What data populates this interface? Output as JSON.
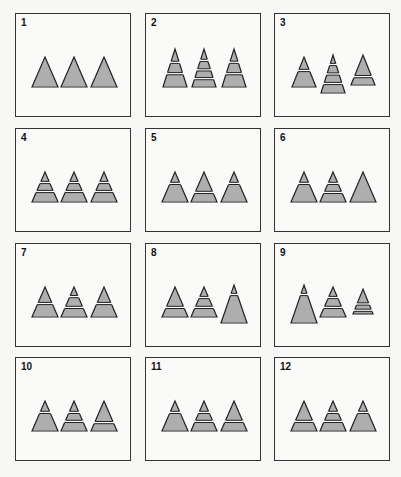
{
  "figure": {
    "colors": {
      "fill": "#a8a8a8",
      "stroke": "#222222",
      "gap": "#fafaf8",
      "frame": "#333333"
    },
    "panels": [
      {
        "label": "1",
        "triangles": [
          {
            "dx": 0,
            "dy": 0,
            "w": 26,
            "h": 30,
            "cuts": []
          },
          {
            "dx": 0,
            "dy": 0,
            "w": 26,
            "h": 30,
            "cuts": []
          },
          {
            "dx": 0,
            "dy": 0,
            "w": 26,
            "h": 30,
            "cuts": []
          }
        ]
      },
      {
        "label": "2",
        "triangles": [
          {
            "dx": 0,
            "dy": 0,
            "w": 24,
            "h": 38,
            "cuts": [
              0.35,
              0.65
            ]
          },
          {
            "dx": 0,
            "dy": 0,
            "w": 24,
            "h": 38,
            "cuts": [
              0.3,
              0.55,
              0.78
            ]
          },
          {
            "dx": 0,
            "dy": 0,
            "w": 24,
            "h": 38,
            "cuts": [
              0.35,
              0.65
            ]
          }
        ]
      },
      {
        "label": "3",
        "triangles": [
          {
            "dx": 0,
            "dy": 0,
            "w": 24,
            "h": 30,
            "cuts": [
              0.45
            ]
          },
          {
            "dx": 0,
            "dy": 6,
            "w": 24,
            "h": 38,
            "cuts": [
              0.25,
              0.5,
              0.75
            ]
          },
          {
            "dx": 0,
            "dy": -2,
            "w": 24,
            "h": 30,
            "cuts": [
              0.72
            ]
          }
        ]
      },
      {
        "label": "4",
        "triangles": [
          {
            "dx": 0,
            "dy": 0,
            "w": 26,
            "h": 30,
            "cuts": [
              0.35,
              0.65
            ]
          },
          {
            "dx": 0,
            "dy": 0,
            "w": 26,
            "h": 30,
            "cuts": [
              0.35,
              0.65
            ]
          },
          {
            "dx": 0,
            "dy": 0,
            "w": 26,
            "h": 30,
            "cuts": [
              0.35,
              0.65
            ]
          }
        ]
      },
      {
        "label": "5",
        "triangles": [
          {
            "dx": 0,
            "dy": 0,
            "w": 26,
            "h": 30,
            "cuts": [
              0.38
            ]
          },
          {
            "dx": 0,
            "dy": 0,
            "w": 26,
            "h": 30,
            "cuts": [
              0.68
            ]
          },
          {
            "dx": 0,
            "dy": 0,
            "w": 26,
            "h": 30,
            "cuts": [
              0.38
            ]
          }
        ]
      },
      {
        "label": "6",
        "triangles": [
          {
            "dx": 0,
            "dy": 0,
            "w": 26,
            "h": 30,
            "cuts": [
              0.38
            ]
          },
          {
            "dx": 0,
            "dy": 0,
            "w": 26,
            "h": 30,
            "cuts": [
              0.38,
              0.68
            ]
          },
          {
            "dx": 0,
            "dy": 0,
            "w": 26,
            "h": 30,
            "cuts": []
          }
        ]
      },
      {
        "label": "7",
        "triangles": [
          {
            "dx": 0,
            "dy": 0,
            "w": 26,
            "h": 30,
            "cuts": [
              0.55
            ]
          },
          {
            "dx": 0,
            "dy": 0,
            "w": 26,
            "h": 30,
            "cuts": [
              0.32,
              0.68
            ]
          },
          {
            "dx": 0,
            "dy": 0,
            "w": 26,
            "h": 30,
            "cuts": [
              0.55
            ]
          }
        ]
      },
      {
        "label": "8",
        "triangles": [
          {
            "dx": 0,
            "dy": 0,
            "w": 26,
            "h": 30,
            "cuts": [
              0.68
            ]
          },
          {
            "dx": 0,
            "dy": 0,
            "w": 26,
            "h": 30,
            "cuts": [
              0.35,
              0.68
            ]
          },
          {
            "dx": 0,
            "dy": 6,
            "w": 26,
            "h": 38,
            "cuts": [
              0.25
            ]
          }
        ]
      },
      {
        "label": "9",
        "triangles": [
          {
            "dx": 0,
            "dy": 6,
            "w": 26,
            "h": 38,
            "cuts": [
              0.25
            ]
          },
          {
            "dx": 0,
            "dy": 0,
            "w": 26,
            "h": 30,
            "cuts": [
              0.35,
              0.68
            ]
          },
          {
            "dx": 0,
            "dy": -3,
            "w": 20,
            "h": 25,
            "cuts": [
              0.6,
              0.85
            ]
          }
        ]
      },
      {
        "label": "10",
        "triangles": [
          {
            "dx": 0,
            "dy": 0,
            "w": 26,
            "h": 30,
            "cuts": [
              0.38
            ]
          },
          {
            "dx": 0,
            "dy": 0,
            "w": 26,
            "h": 30,
            "cuts": [
              0.38,
              0.68
            ]
          },
          {
            "dx": 0,
            "dy": 0,
            "w": 26,
            "h": 30,
            "cuts": [
              0.72
            ]
          }
        ]
      },
      {
        "label": "11",
        "triangles": [
          {
            "dx": 0,
            "dy": 0,
            "w": 26,
            "h": 30,
            "cuts": [
              0.38
            ]
          },
          {
            "dx": 0,
            "dy": 0,
            "w": 26,
            "h": 30,
            "cuts": [
              0.38,
              0.68
            ]
          },
          {
            "dx": 0,
            "dy": 0,
            "w": 26,
            "h": 30,
            "cuts": [
              0.68
            ]
          }
        ]
      },
      {
        "label": "12",
        "triangles": [
          {
            "dx": 0,
            "dy": 0,
            "w": 26,
            "h": 30,
            "cuts": [
              0.68
            ]
          },
          {
            "dx": 0,
            "dy": 0,
            "w": 26,
            "h": 30,
            "cuts": [
              0.38,
              0.68
            ]
          },
          {
            "dx": 0,
            "dy": 0,
            "w": 26,
            "h": 30,
            "cuts": [
              0.38
            ]
          }
        ]
      }
    ]
  }
}
